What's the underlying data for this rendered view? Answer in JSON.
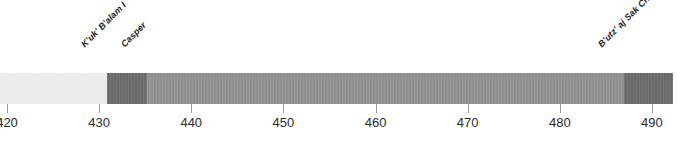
{
  "chart_data": {
    "type": "bar",
    "title": "",
    "subtitle": "",
    "xlabel": "",
    "ylabel": "",
    "orientation": "horizontal",
    "grid": false,
    "legend": "none",
    "xlim": [
      419.2,
      492.3
    ],
    "axis": {
      "ticks": [
        420,
        430,
        440,
        450,
        460,
        470,
        480,
        490
      ],
      "tick_labels": [
        "420",
        "430",
        "440",
        "450",
        "460",
        "470",
        "480",
        "490"
      ]
    },
    "segments": [
      {
        "name": "",
        "start": 419.2,
        "end": 430.8,
        "color": "#eceaea",
        "shade": "light"
      },
      {
        "name": "K'uk' B'alam I",
        "start": 430.8,
        "end": 435.2,
        "color": "#6a6a6a",
        "shade": "dark"
      },
      {
        "name": "Casper",
        "start": 435.2,
        "end": 487.0,
        "color": "#8f8f8f",
        "shade": "mid"
      },
      {
        "name": "B'utz' aj Sak Chiik",
        "start": 487.0,
        "end": 492.3,
        "color": "#6a6a6a",
        "shade": "dark"
      }
    ],
    "markers": [
      {
        "label": "K'uk' B'alam I",
        "year": 430.8
      },
      {
        "label": "Casper",
        "year": 435.2
      },
      {
        "label": "B'utz' aj Sak Chiik",
        "year": 487.0
      }
    ]
  }
}
